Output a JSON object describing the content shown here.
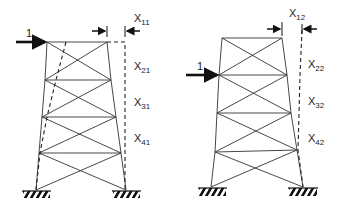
{
  "diagram": {
    "frames": [
      {
        "id": "frame-1",
        "load": {
          "label": "1",
          "applied_at_level": 1
        },
        "displacement_labels": [
          {
            "main": "X",
            "sub": "11"
          },
          {
            "main": "X",
            "sub": "21"
          },
          {
            "main": "X",
            "sub": "31"
          },
          {
            "main": "X",
            "sub": "41"
          }
        ]
      },
      {
        "id": "frame-2",
        "load": {
          "label": "1",
          "applied_at_level": 2
        },
        "displacement_labels": [
          {
            "main": "X",
            "sub": "12"
          },
          {
            "main": "X",
            "sub": "22"
          },
          {
            "main": "X",
            "sub": "32"
          },
          {
            "main": "X",
            "sub": "42"
          }
        ]
      }
    ],
    "colors": {
      "line": "#333333",
      "text": "#222222",
      "background": "#ffffff"
    }
  }
}
